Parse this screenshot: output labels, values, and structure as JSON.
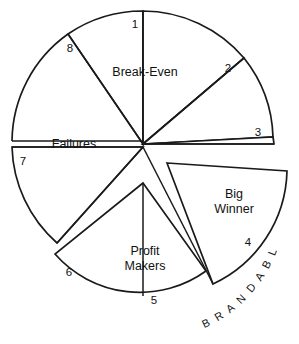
{
  "diagram": {
    "type": "pie-wheel",
    "colors": {
      "stroke": "#1a1a1a",
      "fill": "#ffffff",
      "background": "#ffffff",
      "text": "#111111"
    },
    "segments": [
      {
        "id": "1",
        "number": "1"
      },
      {
        "id": "2",
        "number": "2"
      },
      {
        "id": "3",
        "number": "3"
      },
      {
        "id": "4",
        "number": "4"
      },
      {
        "id": "5",
        "number": "5"
      },
      {
        "id": "6",
        "number": "6"
      },
      {
        "id": "7",
        "number": "7"
      },
      {
        "id": "8",
        "number": "8"
      }
    ],
    "groups": {
      "break_even": "Break-Even",
      "failures": "Failures",
      "profit_makers_line1": "Profit",
      "profit_makers_line2": "Makers",
      "big_winner_line1": "Big",
      "big_winner_line2": "Winner"
    },
    "outer_label": "B R A N D A B L E S"
  }
}
